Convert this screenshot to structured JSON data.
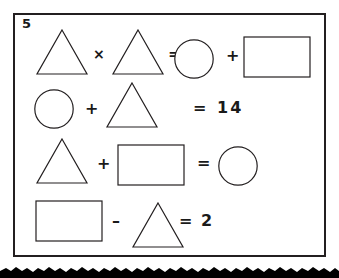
{
  "page": {
    "background_color": "#ffffff",
    "ink_color": "#231f20",
    "width": 339,
    "height": 278
  },
  "worksheet": {
    "question_number": "5",
    "frame": {
      "border_color": "#231f20",
      "border_width": 2
    },
    "equations": [
      {
        "id": "equation-1",
        "reading": "triangle times triangle equals circle plus rectangle",
        "tokens": [
          {
            "kind": "shape",
            "shape": "triangle",
            "label": "triangle"
          },
          {
            "kind": "operator",
            "symbol": "×",
            "label": "multiply"
          },
          {
            "kind": "shape",
            "shape": "triangle",
            "label": "triangle"
          },
          {
            "kind": "operator",
            "symbol": "=",
            "label": "equals"
          },
          {
            "kind": "shape",
            "shape": "circle",
            "label": "circle"
          },
          {
            "kind": "operator",
            "symbol": "+",
            "label": "plus"
          },
          {
            "kind": "shape",
            "shape": "rectangle",
            "label": "rectangle"
          }
        ]
      },
      {
        "id": "equation-2",
        "reading": "circle plus triangle equals 14",
        "tokens": [
          {
            "kind": "shape",
            "shape": "circle",
            "label": "circle"
          },
          {
            "kind": "operator",
            "symbol": "+",
            "label": "plus"
          },
          {
            "kind": "shape",
            "shape": "triangle",
            "label": "triangle"
          },
          {
            "kind": "operator",
            "symbol": "=",
            "label": "equals"
          },
          {
            "kind": "number",
            "symbol": "14",
            "label": "fourteen"
          }
        ]
      },
      {
        "id": "equation-3",
        "reading": "triangle plus rectangle equals circle",
        "tokens": [
          {
            "kind": "shape",
            "shape": "triangle",
            "label": "triangle"
          },
          {
            "kind": "operator",
            "symbol": "+",
            "label": "plus"
          },
          {
            "kind": "shape",
            "shape": "rectangle",
            "label": "rectangle"
          },
          {
            "kind": "operator",
            "symbol": "=",
            "label": "equals"
          },
          {
            "kind": "shape",
            "shape": "circle",
            "label": "circle"
          }
        ]
      },
      {
        "id": "equation-4",
        "reading": "rectangle minus triangle equals 2",
        "tokens": [
          {
            "kind": "shape",
            "shape": "rectangle",
            "label": "rectangle"
          },
          {
            "kind": "operator",
            "symbol": "–",
            "label": "minus"
          },
          {
            "kind": "shape",
            "shape": "triangle",
            "label": "triangle"
          },
          {
            "kind": "operator",
            "symbol": "=",
            "label": "equals"
          },
          {
            "kind": "number",
            "symbol": "2",
            "label": "two"
          }
        ]
      }
    ],
    "symbols": {
      "multiply": "×",
      "plus": "+",
      "minus": "–",
      "equals": "=",
      "fourteen": "14",
      "two": "2"
    },
    "torn_edge": {
      "label": "torn-paper-edge",
      "color": "#000000"
    }
  }
}
